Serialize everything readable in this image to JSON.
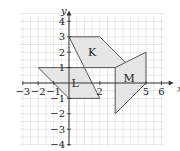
{
  "figure": {
    "origin_px": [
      69,
      83
    ],
    "unit_px": 15.4,
    "grid": {
      "x_range": [
        -3,
        6
      ],
      "y_range": [
        -4,
        4
      ],
      "color": "#d9d9d9"
    },
    "axes": {
      "x_label": "x",
      "y_label": "y",
      "x_ticks": [
        "-3",
        "-2",
        "-1",
        "2",
        "5",
        "6"
      ],
      "y_ticks": [
        "4",
        "3",
        "2",
        "1",
        "-1",
        "-2",
        "-3",
        "-4"
      ],
      "color": "#333333"
    },
    "shapes": [
      {
        "name": "K",
        "vertices": [
          [
            0,
            3
          ],
          [
            2,
            3
          ],
          [
            4,
            1
          ],
          [
            1,
            1
          ]
        ],
        "label_pos": [
          1.5,
          2
        ],
        "fill": "#e6e6e6"
      },
      {
        "name": "L",
        "vertices": [
          [
            -2,
            1
          ],
          [
            1,
            1
          ],
          [
            2,
            -1
          ],
          [
            0,
            -1
          ]
        ],
        "label_pos": [
          0.4,
          0
        ],
        "fill": "#e6e6e6"
      },
      {
        "name": "M",
        "vertices": [
          [
            3,
            1
          ],
          [
            5,
            2
          ],
          [
            5,
            0
          ],
          [
            3,
            -2
          ]
        ],
        "label_pos": [
          3.9,
          0.3
        ],
        "fill": "#e6e6e6"
      }
    ]
  }
}
